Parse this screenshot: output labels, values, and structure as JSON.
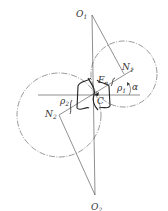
{
  "diagram": {
    "labels": {
      "O1": "O",
      "O1_sub": "1",
      "O2": "O",
      "O2_sub": "2",
      "N1": "N",
      "N1_sub": "1",
      "N2": "N",
      "N2_sub": "2",
      "Fn": "F",
      "Fn_sub": "n",
      "rho1": "ρ",
      "rho1_sub": "1",
      "rho2": "ρ",
      "rho2_sub": "2",
      "C": "C",
      "alpha": "α"
    },
    "colors": {
      "line": "#444444",
      "background": "#ffffff"
    }
  }
}
